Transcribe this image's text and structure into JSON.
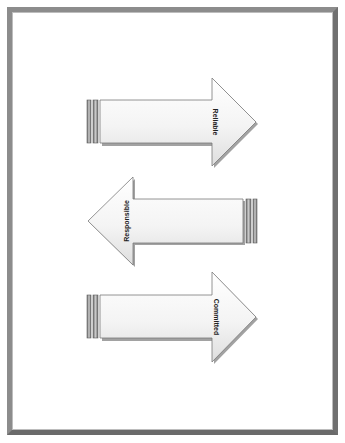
{
  "page": {
    "background": "#ffffff",
    "frame_color": "#808080"
  },
  "diagram": {
    "arrows": [
      {
        "label": "Reliable",
        "direction": "right"
      },
      {
        "label": "Responsible",
        "direction": "left"
      },
      {
        "label": "Committed",
        "direction": "right"
      }
    ],
    "colors": {
      "fill_light": "#ffffff",
      "fill_shade": "#e6e6e6",
      "outline": "#7a7a7a",
      "shadow": "#555555",
      "stripe": "#9a9a9a"
    }
  }
}
